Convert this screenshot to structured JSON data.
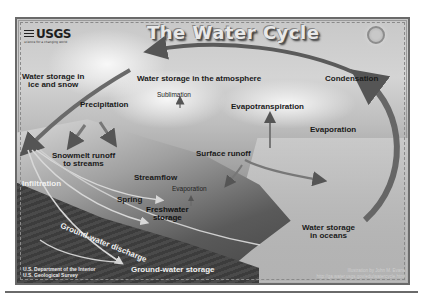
{
  "diagram": {
    "title": "The Water Cycle",
    "logo": {
      "text": "USGS",
      "tagline": "science for a changing world"
    },
    "labels": {
      "ice_snow": [
        "Water storage in",
        "ice and snow"
      ],
      "atmosphere": "Water storage in the atmosphere",
      "condensation": "Condensation",
      "sublimation": "Sublimation",
      "precipitation": "Precipitation",
      "evapotranspiration": "Evapotranspiration",
      "evaporation_ocean": "Evaporation",
      "snowmelt": [
        "Snowmelt runoff",
        "to streams"
      ],
      "surface_runoff": "Surface runoff",
      "streamflow": "Streamflow",
      "evaporation_lake": "Evaporation",
      "infiltration": "Infiltration",
      "spring": "Spring",
      "freshwater": [
        "Freshwater",
        "storage"
      ],
      "groundwater_discharge": "Ground-water discharge",
      "groundwater_storage": "Ground-water storage",
      "oceans": [
        "Water storage",
        "in oceans"
      ]
    },
    "credits": {
      "agency_line1": "U.S. Department of the Interior",
      "agency_line2": "U.S. Geological Survey",
      "illustrator": "Illustration by John M. Evans",
      "url": "http://ga.water.usgs.gov/edu/watercycle.html"
    },
    "icons": {
      "sun": "sun-icon",
      "arrows": "flow-arrow-icon"
    }
  }
}
